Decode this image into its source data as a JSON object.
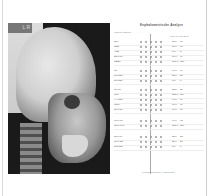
{
  "xray": {
    "label": "L R"
  },
  "sheet": {
    "title": "Kephalometrische Analyse",
    "meta": "Patient:  Datum: . . . . . . . .",
    "colhdr": "Norm  Ist  Abw.  Bem.",
    "rows": [
      {
        "label": "SNA",
        "v1": "82.0",
        "v2": "81"
      },
      {
        "label": "SNB",
        "v1": "80.0",
        "v2": "78"
      },
      {
        "label": "ANB",
        "v1": "2.0",
        "v2": "3"
      },
      {
        "label": "SN-Pog",
        "v1": "81.0",
        "v2": "79"
      },
      {
        "label": "NSBa",
        "v1": "131.0",
        "v2": "130"
      },
      {
        "label": "Gn",
        "v1": "66.0",
        "v2": "67"
      },
      {
        "label": "ML-NSL",
        "v1": "32.0",
        "v2": "33"
      },
      {
        "label": "NL-NSL",
        "v1": "8.5",
        "v2": "8"
      },
      {
        "label": "ML-NL",
        "v1": "23.5",
        "v2": "25"
      },
      {
        "label": "Gon",
        "v1": "125.0",
        "v2": "124"
      },
      {
        "label": "Y-Achse",
        "v1": "66.0",
        "v2": "66"
      },
      {
        "label": "Index",
        "v1": "80.0",
        "v2": "79"
      },
      {
        "label": "OK1-NL",
        "v1": "70.0",
        "v2": "71"
      },
      {
        "label": "UK1-ML",
        "v1": "90.0",
        "v2": "92"
      },
      {
        "label": "OK1-UK1",
        "v1": "131.0",
        "v2": "128"
      },
      {
        "label": "OK1-NA",
        "v1": "22.0",
        "v2": "23"
      },
      {
        "label": "UK1-NB",
        "v1": "25.0",
        "v2": "26"
      },
      {
        "label": "Pog-NB",
        "v1": "2.0",
        "v2": "1"
      }
    ],
    "footer": "Kephalometrische Auswertung"
  }
}
